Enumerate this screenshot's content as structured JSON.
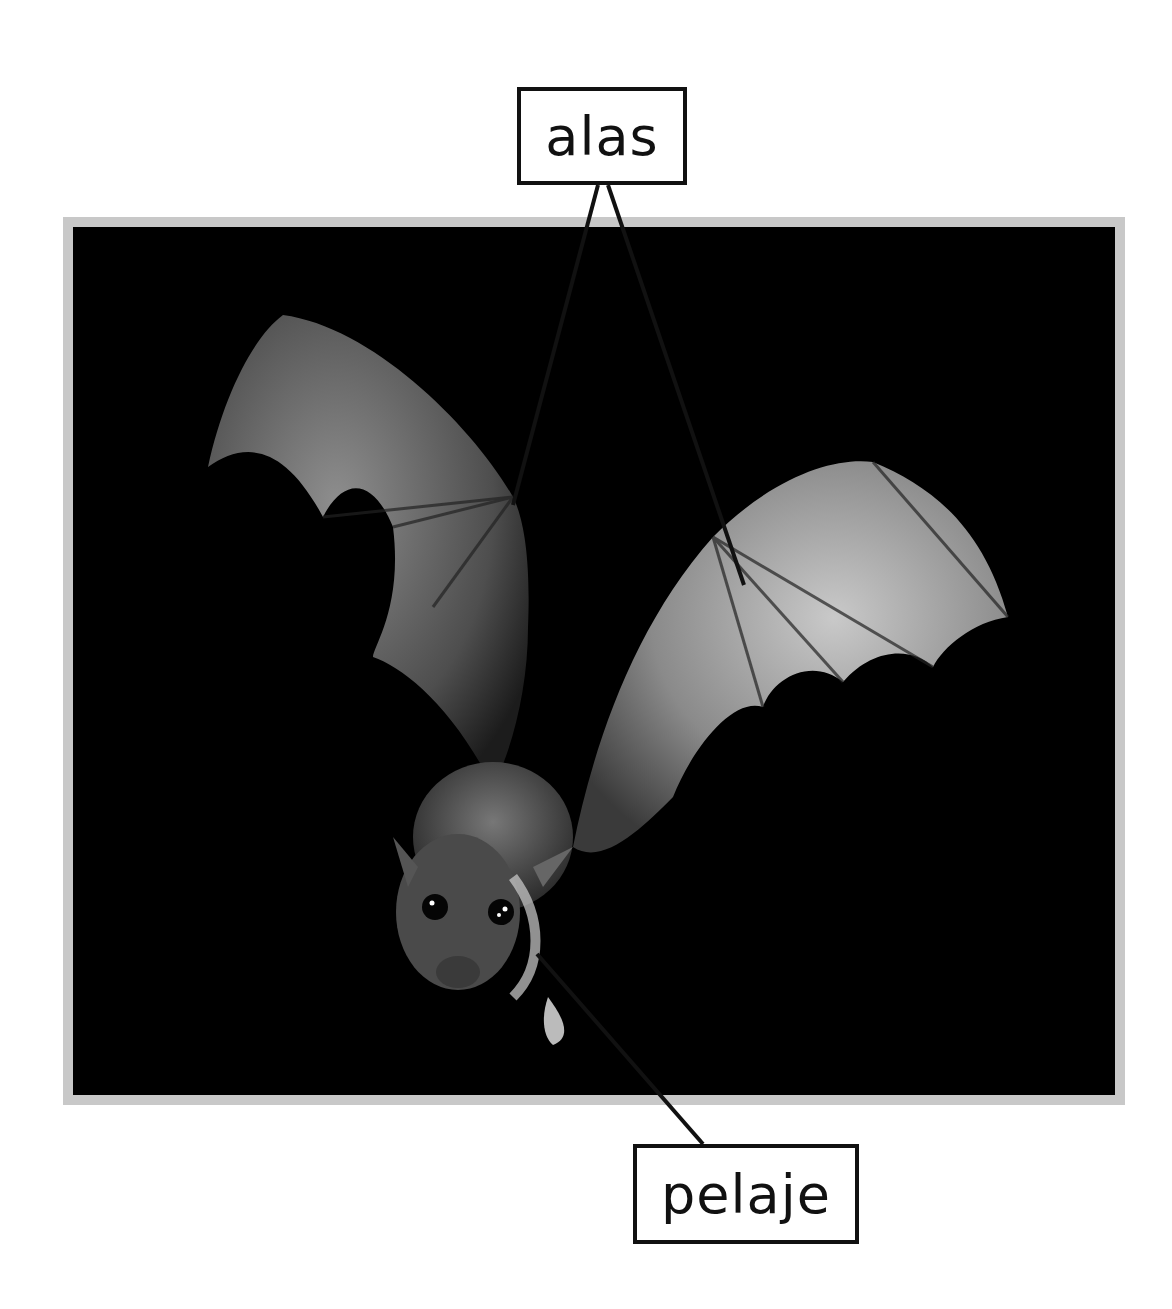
{
  "diagram": {
    "type": "labeled-photo",
    "labels": [
      {
        "id": "alas",
        "text": "alas",
        "points_to": "wings"
      },
      {
        "id": "pelaje",
        "text": "pelaje",
        "points_to": "fur"
      }
    ]
  },
  "colors": {
    "background": "#ffffff",
    "frame": "#c8c8c8",
    "photo_background": "#000000",
    "label_border": "#111111",
    "leader_line": "#111111"
  }
}
